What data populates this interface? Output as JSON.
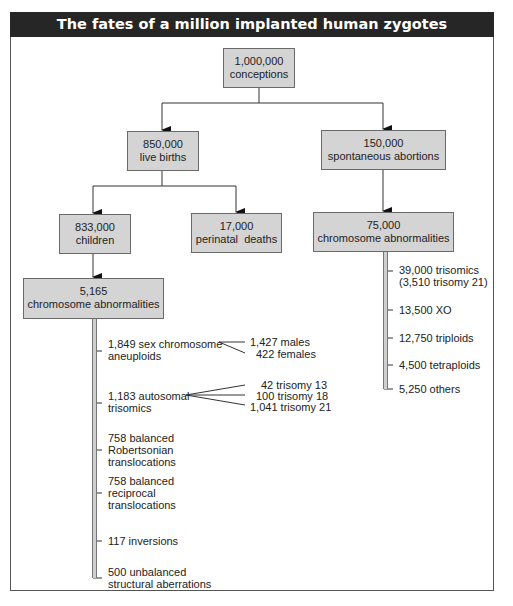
{
  "title": "The fates of a million implanted human zygotes",
  "nodes": {
    "conceptions": {
      "count": "1,000,000",
      "label": "conceptions"
    },
    "live_births": {
      "count": "850,000",
      "label": "live births"
    },
    "spontaneous_abortions": {
      "count": "150,000",
      "label": "spontaneous abortions"
    },
    "children": {
      "count": "833,000",
      "label": "children"
    },
    "perinatal_deaths": {
      "count": "17,000",
      "label": "perinatal  deaths"
    },
    "abortion_abnormalities": {
      "count": "75,000",
      "label": "chromosome abnormalities"
    },
    "child_abnormalities": {
      "count": "5,165",
      "label": "chromosome abnormalities"
    }
  },
  "child_abnormality_breakdown": [
    {
      "lines": [
        "1,849 sex chromosome",
        "aneuploids"
      ]
    },
    {
      "lines": [
        "1,183 autosomal",
        "trisomics"
      ]
    },
    {
      "lines": [
        "758 balanced",
        "Robertsonian",
        "translocations"
      ]
    },
    {
      "lines": [
        "758 balanced",
        "reciprocal",
        "translocations"
      ]
    },
    {
      "lines": [
        "117 inversions"
      ]
    },
    {
      "lines": [
        "500 unbalanced",
        "structural aberrations"
      ]
    }
  ],
  "sex_chromosome_split": [
    "1,427 males",
    "422 females"
  ],
  "autosomal_split": [
    "42 trisomy 13",
    "100 trisomy 18",
    "1,041 trisomy 21"
  ],
  "abortion_abnormality_breakdown": [
    {
      "lines": [
        "39,000 trisomics",
        "(3,510 trisomy 21)"
      ]
    },
    {
      "lines": [
        "13,500 XO"
      ]
    },
    {
      "lines": [
        "12,750 triploids"
      ]
    },
    {
      "lines": [
        "4,500 tetraploids"
      ]
    },
    {
      "lines": [
        "5,250 others"
      ]
    }
  ]
}
